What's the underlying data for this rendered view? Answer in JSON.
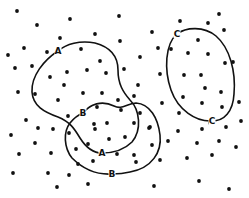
{
  "diagram": {
    "colors": {
      "background": "#ffffff",
      "ink": "#111111"
    },
    "regions": [
      {
        "name": "A",
        "labels": [
          {
            "text": "A",
            "x": 58,
            "y": 51
          },
          {
            "text": "A",
            "x": 102,
            "y": 153
          }
        ],
        "path": "M58,51 C66,44 80,40 95,43 C110,47 118,56 118,70 C118,84 123,92 130,100 C140,110 142,130 132,142 C124,150 112,153 102,153 C92,153 85,146 80,138 C74,128 70,122 58,117 C44,112 33,106 32,92 C31,76 44,60 58,51 Z"
      },
      {
        "name": "B",
        "labels": [
          {
            "text": "B",
            "x": 83,
            "y": 113
          },
          {
            "text": "B",
            "x": 112,
            "y": 174
          }
        ],
        "path": "M83,113 C90,104 102,100 114,106 C122,110 126,104 136,103 C150,104 158,118 160,135 C162,152 152,168 130,172 C122,174 116,174 112,174 C96,175 82,168 72,158 C64,148 63,132 70,123 C74,118 78,115 83,113 Z"
      },
      {
        "name": "C",
        "labels": [
          {
            "text": "C",
            "x": 177,
            "y": 34
          },
          {
            "text": "C",
            "x": 212,
            "y": 121
          }
        ],
        "path": "M177,34 C186,27 204,26 216,36 C230,48 236,72 234,94 C233,112 224,121 212,121 C196,122 178,110 171,90 C164,70 165,44 177,34 Z"
      }
    ],
    "dots": [
      [
        17,
        11
      ],
      [
        37,
        25
      ],
      [
        70,
        19
      ],
      [
        8,
        55
      ],
      [
        24,
        48
      ],
      [
        47,
        52
      ],
      [
        60,
        38
      ],
      [
        81,
        49
      ],
      [
        119,
        16
      ],
      [
        95,
        34
      ],
      [
        120,
        41
      ],
      [
        152,
        32
      ],
      [
        140,
        57
      ],
      [
        158,
        48
      ],
      [
        100,
        61
      ],
      [
        180,
        21
      ],
      [
        208,
        23
      ],
      [
        219,
        14
      ],
      [
        224,
        30
      ],
      [
        171,
        49
      ],
      [
        198,
        40
      ],
      [
        188,
        53
      ],
      [
        208,
        54
      ],
      [
        225,
        63
      ],
      [
        233,
        62
      ],
      [
        15,
        68
      ],
      [
        32,
        66
      ],
      [
        50,
        77
      ],
      [
        67,
        72
      ],
      [
        64,
        85
      ],
      [
        18,
        92
      ],
      [
        35,
        94
      ],
      [
        58,
        100
      ],
      [
        26,
        120
      ],
      [
        68,
        116
      ],
      [
        38,
        128
      ],
      [
        53,
        129
      ],
      [
        87,
        70
      ],
      [
        106,
        73
      ],
      [
        124,
        69
      ],
      [
        160,
        74
      ],
      [
        83,
        93
      ],
      [
        102,
        93
      ],
      [
        138,
        85
      ],
      [
        134,
        96
      ],
      [
        118,
        100
      ],
      [
        97,
        107
      ],
      [
        121,
        110
      ],
      [
        140,
        113
      ],
      [
        162,
        103
      ],
      [
        94,
        124
      ],
      [
        107,
        123
      ],
      [
        134,
        123
      ],
      [
        150,
        127
      ],
      [
        184,
        75
      ],
      [
        201,
        75
      ],
      [
        205,
        88
      ],
      [
        221,
        92
      ],
      [
        183,
        97
      ],
      [
        202,
        103
      ],
      [
        222,
        107
      ],
      [
        239,
        102
      ],
      [
        179,
        113
      ],
      [
        210,
        123
      ],
      [
        241,
        121
      ],
      [
        178,
        131
      ],
      [
        11,
        135
      ],
      [
        35,
        143
      ],
      [
        69,
        133
      ],
      [
        19,
        154
      ],
      [
        51,
        153
      ],
      [
        76,
        149
      ],
      [
        13,
        173
      ],
      [
        48,
        173
      ],
      [
        69,
        175
      ],
      [
        57,
        187
      ],
      [
        78,
        164
      ],
      [
        95,
        129
      ],
      [
        109,
        139
      ],
      [
        125,
        137
      ],
      [
        149,
        128
      ],
      [
        88,
        144
      ],
      [
        117,
        154
      ],
      [
        134,
        155
      ],
      [
        152,
        145
      ],
      [
        93,
        161
      ],
      [
        136,
        162
      ],
      [
        160,
        160
      ],
      [
        88,
        184
      ],
      [
        154,
        186
      ],
      [
        202,
        129
      ],
      [
        226,
        127
      ],
      [
        168,
        141
      ],
      [
        197,
        143
      ],
      [
        219,
        141
      ],
      [
        236,
        147
      ],
      [
        187,
        158
      ],
      [
        212,
        155
      ],
      [
        199,
        181
      ],
      [
        229,
        189
      ]
    ]
  }
}
